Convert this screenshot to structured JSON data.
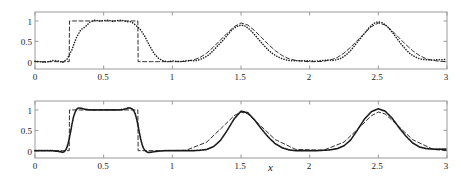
{
  "figure": {
    "width": 461,
    "height": 179,
    "background": "#ffffff",
    "axis_color": "#9a9a9a",
    "curve_color": "#1a1a1a"
  },
  "panels": [
    {
      "id": "top",
      "annotation": "h = 1/30",
      "annotation_h": "h",
      "annotation_eq": "=",
      "annotation_value": "1/30",
      "xlabel": "",
      "ylabel": "",
      "xticks": [
        "0",
        "0.5",
        "1",
        "1.5",
        "2",
        "2.5",
        "3"
      ],
      "xtick_values": [
        0,
        0.5,
        1,
        1.5,
        2,
        2.5,
        3
      ],
      "yticks": [
        "0",
        "0.5",
        "1"
      ],
      "ytick_values": [
        0,
        0.5,
        1
      ],
      "xlim": [
        0,
        3
      ],
      "ylim": [
        -0.18,
        1.22
      ]
    },
    {
      "id": "bottom",
      "annotation": "h = 1/120",
      "annotation_h": "h",
      "annotation_eq": "=",
      "annotation_value": "1/120",
      "xlabel": "x",
      "ylabel": "",
      "xticks": [
        "0",
        "0.5",
        "1",
        "1.5",
        "2",
        "2.5",
        "3"
      ],
      "xtick_values": [
        0,
        0.5,
        1,
        1.5,
        2,
        2.5,
        3
      ],
      "yticks": [
        "0",
        "0.5",
        "1"
      ],
      "ytick_values": [
        0,
        0.5,
        1
      ],
      "xlim": [
        0,
        3
      ],
      "ylim": [
        -0.18,
        1.22
      ]
    }
  ],
  "chart_data": [
    {
      "type": "line",
      "title": "",
      "subtitle": "",
      "annotation": "h = 1/30",
      "xlabel": "",
      "ylabel": "",
      "xlim": [
        0,
        3
      ],
      "ylim": [
        -0.18,
        1.22
      ],
      "xticks": [
        0,
        0.5,
        1,
        1.5,
        2,
        2.5,
        3
      ],
      "yticks": [
        0,
        0.5,
        1
      ],
      "grid": false,
      "legend": "none",
      "series": [
        {
          "name": "exact solution",
          "style": "dashed",
          "color": "#1a1a1a",
          "x": [
            0.0,
            0.05,
            0.1,
            0.15,
            0.2,
            0.249,
            0.251,
            0.3,
            0.35,
            0.4,
            0.45,
            0.5,
            0.55,
            0.6,
            0.65,
            0.7,
            0.749,
            0.751,
            0.8,
            0.85,
            0.9,
            0.95,
            1.0,
            1.05,
            1.1,
            1.15,
            1.2,
            1.25,
            1.3,
            1.35,
            1.4,
            1.45,
            1.5,
            1.55,
            1.6,
            1.65,
            1.7,
            1.75,
            1.8,
            1.85,
            1.9,
            1.95,
            2.0,
            2.05,
            2.1,
            2.15,
            2.2,
            2.25,
            2.3,
            2.35,
            2.4,
            2.45,
            2.5,
            2.55,
            2.6,
            2.65,
            2.7,
            2.75,
            2.8,
            2.85,
            2.9,
            2.95,
            3.0
          ],
          "y": [
            0.0,
            0.0,
            0.0,
            0.0,
            0.0,
            0.0,
            1.0,
            1.0,
            1.0,
            1.0,
            1.0,
            1.0,
            1.0,
            1.0,
            1.0,
            1.0,
            1.0,
            0.0,
            0.0,
            0.0,
            0.0,
            0.0,
            0.0,
            0.0,
            0.01,
            0.04,
            0.1,
            0.21,
            0.36,
            0.53,
            0.7,
            0.86,
            0.95,
            0.9,
            0.76,
            0.59,
            0.42,
            0.27,
            0.15,
            0.07,
            0.03,
            0.01,
            0.0,
            0.0,
            0.01,
            0.04,
            0.1,
            0.21,
            0.36,
            0.53,
            0.7,
            0.86,
            0.95,
            0.9,
            0.76,
            0.59,
            0.42,
            0.27,
            0.15,
            0.07,
            0.03,
            0.01,
            0.0
          ]
        },
        {
          "name": "numerical solution h = 1/30",
          "style": "dotted",
          "color": "#1a1a1a",
          "x": [
            0.0,
            0.033,
            0.067,
            0.1,
            0.133,
            0.167,
            0.2,
            0.233,
            0.267,
            0.3,
            0.333,
            0.367,
            0.4,
            0.433,
            0.467,
            0.5,
            0.533,
            0.567,
            0.6,
            0.633,
            0.667,
            0.7,
            0.733,
            0.767,
            0.8,
            0.833,
            0.867,
            0.9,
            0.933,
            0.967,
            1.0,
            1.033,
            1.067,
            1.1,
            1.133,
            1.167,
            1.2,
            1.233,
            1.267,
            1.3,
            1.333,
            1.367,
            1.4,
            1.433,
            1.467,
            1.5,
            1.533,
            1.567,
            1.6,
            1.633,
            1.667,
            1.7,
            1.733,
            1.767,
            1.8,
            1.833,
            1.867,
            1.9,
            1.933,
            1.967,
            2.0,
            2.033,
            2.067,
            2.1,
            2.133,
            2.167,
            2.2,
            2.233,
            2.267,
            2.3,
            2.333,
            2.367,
            2.4,
            2.433,
            2.467,
            2.5,
            2.533,
            2.567,
            2.6,
            2.633,
            2.667,
            2.7,
            2.733,
            2.767,
            2.8,
            2.833,
            2.867,
            2.9,
            2.933,
            2.967,
            3.0
          ],
          "y": [
            0.01,
            0.0,
            -0.02,
            0.0,
            0.03,
            0.02,
            -0.02,
            0.06,
            0.28,
            0.58,
            0.78,
            0.86,
            0.97,
            1.02,
            1.0,
            1.01,
            1.02,
            0.99,
            1.01,
            1.02,
            0.98,
            0.98,
            0.9,
            0.79,
            0.62,
            0.4,
            0.2,
            0.08,
            0.02,
            0.0,
            0.02,
            0.01,
            0.0,
            0.02,
            0.03,
            0.02,
            0.05,
            0.1,
            0.17,
            0.28,
            0.4,
            0.52,
            0.65,
            0.78,
            0.86,
            0.9,
            0.87,
            0.78,
            0.66,
            0.53,
            0.4,
            0.28,
            0.19,
            0.12,
            0.07,
            0.04,
            0.02,
            0.02,
            0.02,
            0.02,
            0.02,
            0.01,
            0.02,
            0.03,
            0.04,
            0.03,
            0.05,
            0.09,
            0.17,
            0.28,
            0.42,
            0.56,
            0.7,
            0.84,
            0.94,
            0.98,
            0.95,
            0.86,
            0.73,
            0.58,
            0.43,
            0.3,
            0.19,
            0.12,
            0.07,
            0.05,
            0.04,
            0.04,
            0.05,
            0.05,
            0.06
          ]
        }
      ]
    },
    {
      "type": "line",
      "title": "",
      "subtitle": "",
      "annotation": "h = 1/120",
      "xlabel": "x",
      "ylabel": "",
      "xlim": [
        0,
        3
      ],
      "ylim": [
        -0.18,
        1.22
      ],
      "xticks": [
        0,
        0.5,
        1,
        1.5,
        2,
        2.5,
        3
      ],
      "yticks": [
        0,
        0.5,
        1
      ],
      "grid": false,
      "legend": "none",
      "series": [
        {
          "name": "exact solution",
          "style": "dashed",
          "color": "#1a1a1a",
          "x": [
            0.0,
            0.1,
            0.2,
            0.249,
            0.251,
            0.4,
            0.6,
            0.749,
            0.751,
            0.9,
            1.1,
            1.25,
            1.35,
            1.45,
            1.5,
            1.55,
            1.65,
            1.75,
            1.9,
            2.1,
            2.25,
            2.35,
            2.45,
            2.5,
            2.55,
            2.65,
            2.75,
            2.9,
            3.0
          ],
          "y": [
            0.0,
            0.0,
            0.0,
            0.0,
            1.0,
            1.0,
            1.0,
            1.0,
            0.0,
            0.0,
            0.01,
            0.21,
            0.53,
            0.86,
            0.95,
            0.9,
            0.59,
            0.27,
            0.03,
            0.01,
            0.21,
            0.53,
            0.86,
            0.95,
            0.9,
            0.59,
            0.27,
            0.03,
            0.0
          ]
        },
        {
          "name": "numerical solution h = 1/120",
          "style": "solid-dotted",
          "color": "#1a1a1a",
          "x": [
            0.0,
            0.025,
            0.05,
            0.075,
            0.1,
            0.125,
            0.15,
            0.175,
            0.19,
            0.2,
            0.21,
            0.22,
            0.23,
            0.24,
            0.25,
            0.26,
            0.27,
            0.28,
            0.29,
            0.3,
            0.31,
            0.32,
            0.34,
            0.36,
            0.4,
            0.45,
            0.5,
            0.55,
            0.6,
            0.64,
            0.66,
            0.68,
            0.69,
            0.7,
            0.71,
            0.72,
            0.73,
            0.74,
            0.75,
            0.76,
            0.77,
            0.78,
            0.79,
            0.8,
            0.81,
            0.82,
            0.84,
            0.86,
            0.9,
            0.95,
            1.0,
            1.05,
            1.1,
            1.15,
            1.2,
            1.25,
            1.3,
            1.35,
            1.4,
            1.45,
            1.5,
            1.55,
            1.6,
            1.65,
            1.7,
            1.75,
            1.8,
            1.85,
            1.9,
            1.95,
            2.0,
            2.05,
            2.1,
            2.15,
            2.2,
            2.25,
            2.3,
            2.35,
            2.4,
            2.45,
            2.5,
            2.55,
            2.6,
            2.65,
            2.7,
            2.75,
            2.8,
            2.85,
            2.9,
            2.95,
            3.0
          ],
          "y": [
            0.0,
            0.0,
            0.0,
            0.0,
            0.0,
            0.0,
            -0.01,
            -0.02,
            -0.03,
            -0.04,
            -0.03,
            0.0,
            0.06,
            0.16,
            0.3,
            0.48,
            0.66,
            0.82,
            0.93,
            1.0,
            1.04,
            1.05,
            1.04,
            1.02,
            1.0,
            1.0,
            1.0,
            1.0,
            1.0,
            1.01,
            1.03,
            1.05,
            1.05,
            1.04,
            1.02,
            0.98,
            0.9,
            0.78,
            0.62,
            0.44,
            0.28,
            0.15,
            0.06,
            0.01,
            -0.02,
            -0.04,
            -0.04,
            -0.03,
            -0.01,
            0.0,
            0.0,
            0.0,
            0.0,
            0.0,
            0.01,
            0.03,
            0.1,
            0.25,
            0.5,
            0.78,
            0.97,
            0.93,
            0.75,
            0.53,
            0.33,
            0.17,
            0.07,
            0.02,
            0.0,
            0.0,
            0.0,
            0.0,
            0.01,
            0.02,
            0.05,
            0.12,
            0.27,
            0.52,
            0.78,
            0.96,
            1.03,
            0.97,
            0.8,
            0.57,
            0.36,
            0.19,
            0.09,
            0.05,
            0.04,
            0.04,
            0.04,
            0.05
          ]
        }
      ]
    }
  ]
}
